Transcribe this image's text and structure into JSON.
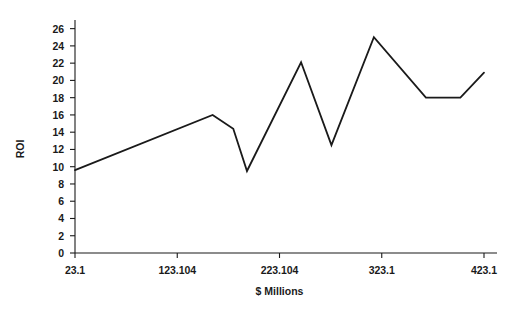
{
  "chart_data": {
    "type": "line",
    "title": "",
    "xlabel": "$ Millions",
    "ylabel": "ROI",
    "xlim": [
      23.1,
      423.1
    ],
    "ylim": [
      0,
      27
    ],
    "grid": false,
    "legend": false,
    "y_ticks": [
      0,
      2,
      4,
      6,
      8,
      10,
      12,
      14,
      16,
      18,
      20,
      22,
      24,
      26
    ],
    "y_tick_labels": [
      "0",
      "2",
      "4",
      "6",
      "8",
      "10",
      "12",
      "14",
      "16",
      "18",
      "20",
      "22",
      "24",
      "26"
    ],
    "x_ticks": [
      23.1,
      123.104,
      223.104,
      323.1,
      423.1
    ],
    "x_tick_labels": [
      "23.1",
      "123.104",
      "223.104",
      "323.1",
      "423.1"
    ],
    "series": [
      {
        "name": "ROI",
        "color": "#1a1a1a",
        "x": [
          23.1,
          157.7,
          177.9,
          237.5,
          263.3,
          244.2,
          244.2,
          284.6,
          332.7,
          352.9,
          386.5,
          423.1
        ],
        "y": [
          9.6,
          16.0,
          14.4,
          9.5,
          22.1,
          12.5,
          12.5,
          25.0,
          18.0,
          18.0,
          20.0,
          20.9
        ],
        "points": [
          {
            "x": 23.1,
            "y": 9.6
          },
          {
            "x": 157.7,
            "y": 16.0
          },
          {
            "x": 177.9,
            "y": 14.4
          },
          {
            "x": 191.3,
            "y": 9.5
          },
          {
            "x": 244.2,
            "y": 22.1
          },
          {
            "x": 273.9,
            "y": 12.5
          },
          {
            "x": 315.4,
            "y": 25.0
          },
          {
            "x": 366.3,
            "y": 18.0
          },
          {
            "x": 400.0,
            "y": 18.0
          },
          {
            "x": 423.1,
            "y": 20.9
          }
        ]
      }
    ]
  },
  "axes": {
    "y_title": "ROI",
    "x_title": "$ Millions"
  }
}
